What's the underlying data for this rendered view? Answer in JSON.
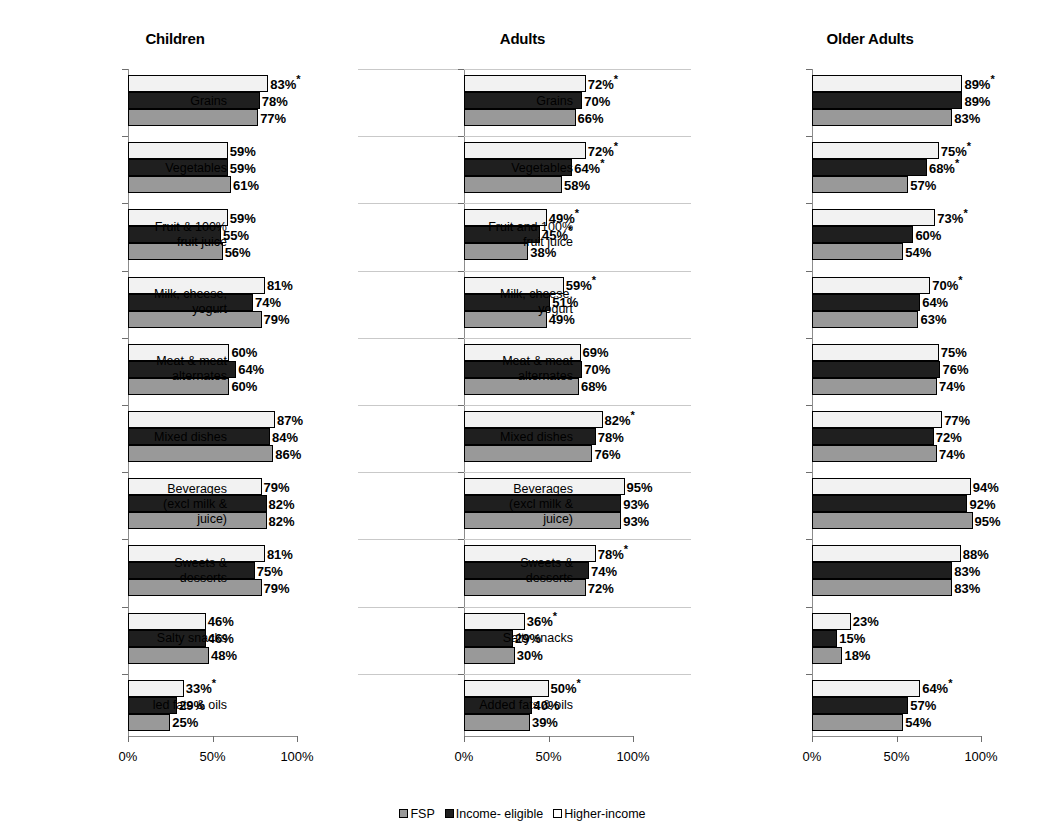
{
  "chart_data": {
    "type": "bar",
    "orientation": "horizontal",
    "title": "",
    "xlabel": "",
    "ylabel": "",
    "xlim": [
      0,
      100
    ],
    "xtick_labels": [
      "0%",
      "50%",
      "100%"
    ],
    "xticks": [
      0,
      50,
      100
    ],
    "grid": false,
    "legend_position": "bottom-center",
    "value_suffix": "%",
    "significance_marker": "*",
    "series": [
      {
        "name": "FSP",
        "color": "#999999",
        "order": 3
      },
      {
        "name": "Income- eligible",
        "color": "#1f1f1f",
        "order": 2
      },
      {
        "name": "Higher-income",
        "color": "#f2f2f2",
        "order": 1
      }
    ],
    "panels": [
      {
        "title": "Children",
        "separators": false,
        "categories": [
          {
            "label": [
              "Grains"
            ],
            "higher_income": 83,
            "higher_income_sig": true,
            "income_eligible": 78,
            "income_eligible_sig": false,
            "fsp": 77,
            "fsp_sig": false
          },
          {
            "label": [
              "Vegetables"
            ],
            "higher_income": 59,
            "higher_income_sig": false,
            "income_eligible": 59,
            "income_eligible_sig": false,
            "fsp": 61,
            "fsp_sig": false
          },
          {
            "label": [
              "Fruit & 100%",
              "fruit juice"
            ],
            "higher_income": 59,
            "higher_income_sig": false,
            "income_eligible": 55,
            "income_eligible_sig": false,
            "fsp": 56,
            "fsp_sig": false
          },
          {
            "label": [
              "Milk, cheese,",
              "yogurt"
            ],
            "higher_income": 81,
            "higher_income_sig": false,
            "income_eligible": 74,
            "income_eligible_sig": false,
            "fsp": 79,
            "fsp_sig": false
          },
          {
            "label": [
              "Meat & meat",
              "alternates"
            ],
            "higher_income": 60,
            "higher_income_sig": false,
            "income_eligible": 64,
            "income_eligible_sig": false,
            "fsp": 60,
            "fsp_sig": false
          },
          {
            "label": [
              "Mixed dishes"
            ],
            "higher_income": 87,
            "higher_income_sig": false,
            "income_eligible": 84,
            "income_eligible_sig": false,
            "fsp": 86,
            "fsp_sig": false
          },
          {
            "label": [
              "Beverages",
              "(excl milk &",
              "juice)"
            ],
            "higher_income": 79,
            "higher_income_sig": false,
            "income_eligible": 82,
            "income_eligible_sig": false,
            "fsp": 82,
            "fsp_sig": false
          },
          {
            "label": [
              "Sweets &",
              "desserts"
            ],
            "higher_income": 81,
            "higher_income_sig": false,
            "income_eligible": 75,
            "income_eligible_sig": false,
            "fsp": 79,
            "fsp_sig": false
          },
          {
            "label": [
              "Salty snacks"
            ],
            "higher_income": 46,
            "higher_income_sig": false,
            "income_eligible": 46,
            "income_eligible_sig": false,
            "fsp": 48,
            "fsp_sig": false
          },
          {
            "label": [
              "Added fats & oils"
            ],
            "higher_income": 33,
            "higher_income_sig": true,
            "income_eligible": 29,
            "income_eligible_sig": false,
            "fsp": 25,
            "fsp_sig": false
          }
        ]
      },
      {
        "title": "Adults",
        "separators": true,
        "categories": [
          {
            "label": [
              "Grains"
            ],
            "higher_income": 72,
            "higher_income_sig": true,
            "income_eligible": 70,
            "income_eligible_sig": false,
            "fsp": 66,
            "fsp_sig": false
          },
          {
            "label": [
              "Vegetables"
            ],
            "higher_income": 72,
            "higher_income_sig": true,
            "income_eligible": 64,
            "income_eligible_sig": true,
            "fsp": 58,
            "fsp_sig": false
          },
          {
            "label": [
              "Fruit & 100%",
              "fruit juice"
            ],
            "higher_income": 49,
            "higher_income_sig": true,
            "income_eligible": 45,
            "income_eligible_sig": true,
            "fsp": 38,
            "fsp_sig": false
          },
          {
            "label": [
              "Milk, cheese,",
              "yogurt"
            ],
            "higher_income": 59,
            "higher_income_sig": true,
            "income_eligible": 51,
            "income_eligible_sig": false,
            "fsp": 49,
            "fsp_sig": false
          },
          {
            "label": [
              "Meat & meat",
              "alternates"
            ],
            "higher_income": 69,
            "higher_income_sig": false,
            "income_eligible": 70,
            "income_eligible_sig": false,
            "fsp": 68,
            "fsp_sig": false
          },
          {
            "label": [
              "Mixed dishes"
            ],
            "higher_income": 82,
            "higher_income_sig": true,
            "income_eligible": 78,
            "income_eligible_sig": false,
            "fsp": 76,
            "fsp_sig": false
          },
          {
            "label": [
              "Beverages",
              "(excl milk &",
              "juice)"
            ],
            "higher_income": 95,
            "higher_income_sig": false,
            "income_eligible": 93,
            "income_eligible_sig": false,
            "fsp": 93,
            "fsp_sig": false
          },
          {
            "label": [
              "Sweets &",
              "desserts"
            ],
            "higher_income": 78,
            "higher_income_sig": true,
            "income_eligible": 74,
            "income_eligible_sig": false,
            "fsp": 72,
            "fsp_sig": false
          },
          {
            "label": [
              "Salty snacks"
            ],
            "higher_income": 36,
            "higher_income_sig": true,
            "income_eligible": 29,
            "income_eligible_sig": false,
            "fsp": 30,
            "fsp_sig": false
          },
          {
            "label": [
              "led fats & oils"
            ],
            "higher_income": 50,
            "higher_income_sig": true,
            "income_eligible": 40,
            "income_eligible_sig": false,
            "fsp": 39,
            "fsp_sig": false
          }
        ]
      },
      {
        "title": "Older Adults",
        "separators": false,
        "categories": [
          {
            "label": [
              "Grains"
            ],
            "higher_income": 89,
            "higher_income_sig": true,
            "income_eligible": 89,
            "income_eligible_sig": false,
            "fsp": 83,
            "fsp_sig": false
          },
          {
            "label": [
              "Vegetables"
            ],
            "higher_income": 75,
            "higher_income_sig": true,
            "income_eligible": 68,
            "income_eligible_sig": true,
            "fsp": 57,
            "fsp_sig": false
          },
          {
            "label": [
              "Fruit and 100%",
              "fruit juice"
            ],
            "higher_income": 73,
            "higher_income_sig": true,
            "income_eligible": 60,
            "income_eligible_sig": false,
            "fsp": 54,
            "fsp_sig": false
          },
          {
            "label": [
              "Milk, cheese,",
              "yogurt"
            ],
            "higher_income": 70,
            "higher_income_sig": true,
            "income_eligible": 64,
            "income_eligible_sig": false,
            "fsp": 63,
            "fsp_sig": false
          },
          {
            "label": [
              "Meat & meat",
              "alternates"
            ],
            "higher_income": 75,
            "higher_income_sig": false,
            "income_eligible": 76,
            "income_eligible_sig": false,
            "fsp": 74,
            "fsp_sig": false
          },
          {
            "label": [
              "Mixed dishes"
            ],
            "higher_income": 77,
            "higher_income_sig": false,
            "income_eligible": 72,
            "income_eligible_sig": false,
            "fsp": 74,
            "fsp_sig": false
          },
          {
            "label": [
              "Beverages",
              "(excl milk &",
              "juice)"
            ],
            "higher_income": 94,
            "higher_income_sig": false,
            "income_eligible": 92,
            "income_eligible_sig": false,
            "fsp": 95,
            "fsp_sig": false
          },
          {
            "label": [
              "Sweets &",
              "desserts"
            ],
            "higher_income": 88,
            "higher_income_sig": false,
            "income_eligible": 83,
            "income_eligible_sig": false,
            "fsp": 83,
            "fsp_sig": false
          },
          {
            "label": [
              "Salty snacks"
            ],
            "higher_income": 23,
            "higher_income_sig": false,
            "income_eligible": 15,
            "income_eligible_sig": false,
            "fsp": 18,
            "fsp_sig": false
          },
          {
            "label": [
              "Added fats & oils"
            ],
            "higher_income": 64,
            "higher_income_sig": true,
            "income_eligible": 57,
            "income_eligible_sig": false,
            "fsp": 54,
            "fsp_sig": false
          }
        ]
      }
    ]
  },
  "legend": {
    "items": [
      {
        "label": "FSP",
        "swatch": "fsp"
      },
      {
        "label": "Income- eligible",
        "swatch": "eligible"
      },
      {
        "label": "Higher-income",
        "swatch": "higher"
      }
    ]
  }
}
